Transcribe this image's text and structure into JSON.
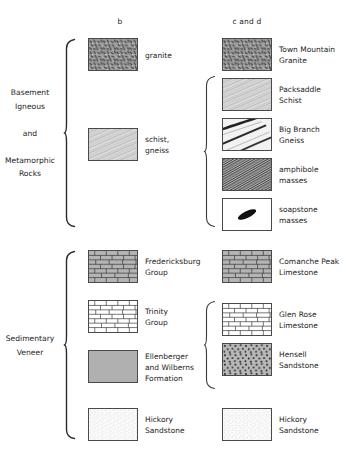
{
  "figure": {
    "background_color": "#ffffff",
    "line_color": "#4a4a4a",
    "text_color": "#222222"
  },
  "columns": [
    {
      "id": "b",
      "label": "b",
      "x": 120
    },
    {
      "id": "c_and_d",
      "label": "c and d",
      "x": 247
    }
  ],
  "groups": [
    {
      "id": "basement",
      "label": "Basement\nIgneous\n\nand\n\nMetamorphic\nRocks",
      "brace_top": 38,
      "brace_bottom": 228
    },
    {
      "id": "sedimentary",
      "label": "Sedimentary\nVeneer",
      "brace_top": 250,
      "brace_bottom": 440
    }
  ],
  "subbraces": [
    {
      "id": "metamorphic-subbrace",
      "top": 75,
      "bottom": 228
    },
    {
      "id": "trinity-subbrace",
      "top": 300,
      "bottom": 390
    }
  ],
  "units": {
    "column_b": [
      {
        "id": "granite",
        "label": "granite",
        "pattern": "granite-speckle",
        "fill": "#9a9a9a",
        "y": 38
      },
      {
        "id": "schist-gneiss",
        "label": "schist,\ngneiss",
        "pattern": "schist-diagonal",
        "fill": "#efefef",
        "y": 128
      },
      {
        "id": "fredericksburg-group",
        "label": "Fredericksburg\nGroup",
        "pattern": "brick-gray",
        "fill": "#b4b4b4",
        "y": 250
      },
      {
        "id": "trinity-group",
        "label": "Trinity\nGroup",
        "pattern": "brick-white",
        "fill": "#ffffff",
        "y": 300
      },
      {
        "id": "ellenberger-wilberns",
        "label": "Ellenberger\nand Wilberns\nFormation",
        "pattern": "solid-gray",
        "fill": "#b0b0b0",
        "y": 350
      },
      {
        "id": "hickory-sandstone-b",
        "label": "Hickory\nSandstone",
        "pattern": "fine-stipple",
        "fill": "#fafafa",
        "y": 408
      }
    ],
    "column_c_and_d": [
      {
        "id": "town-mountain-granite",
        "label": "Town Mountain\nGranite",
        "pattern": "granite-speckle",
        "fill": "#9a9a9a",
        "y": 38
      },
      {
        "id": "packsaddle-schist",
        "label": "Packsaddle\nSchist",
        "pattern": "schist-diagonal",
        "fill": "#efefef",
        "y": 78
      },
      {
        "id": "big-branch-gneiss",
        "label": "Big Branch\nGneiss",
        "pattern": "gneiss-bands",
        "fill": "#f2f2f2",
        "y": 118
      },
      {
        "id": "amphibole-masses",
        "label": "amphibole\nmasses",
        "pattern": "amphibole-dense",
        "fill": "#8d8d8d",
        "y": 158
      },
      {
        "id": "soapstone-masses",
        "label": "soapstone\nmasses",
        "pattern": "soapstone-lens",
        "fill": "#ffffff",
        "y": 198
      },
      {
        "id": "comanche-peak-limestone",
        "label": "Comanche Peak\nLimestone",
        "pattern": "brick-gray",
        "fill": "#b4b4b4",
        "y": 250
      },
      {
        "id": "glen-rose-limestone",
        "label": "Glen Rose\nLimestone",
        "pattern": "brick-white",
        "fill": "#ffffff",
        "y": 303
      },
      {
        "id": "hensell-sandstone",
        "label": "Hensell\nSandstone",
        "pattern": "sandstone-dots",
        "fill": "#b8b8b8",
        "y": 343
      },
      {
        "id": "hickory-sandstone-cd",
        "label": "Hickory\nSandstone",
        "pattern": "fine-stipple",
        "fill": "#fafafa",
        "y": 408
      }
    ]
  }
}
